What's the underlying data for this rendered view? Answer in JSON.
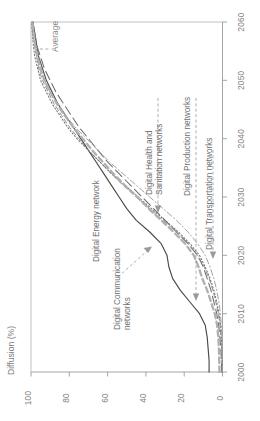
{
  "chart_data": {
    "type": "line",
    "title": "",
    "subtitle": "",
    "orientation": "rotated-90-ccw",
    "xlabel": "",
    "ylabel": "Diffusion (%)",
    "xlim": [
      2000,
      2060
    ],
    "ylim": [
      0,
      100
    ],
    "grid": false,
    "legend_position": "inline-annotations",
    "x_ticks": [
      "2000",
      "2010",
      "2020",
      "2030",
      "2040",
      "2050",
      "2060"
    ],
    "x_tick_values": [
      2000,
      2010,
      2020,
      2030,
      2040,
      2050,
      2060
    ],
    "y_ticks": [
      "0",
      "20",
      "40",
      "60",
      "80",
      "100"
    ],
    "y_tick_values": [
      0,
      20,
      40,
      60,
      80,
      100
    ],
    "x": [
      2000,
      2002,
      2004,
      2006,
      2008,
      2010,
      2012,
      2014,
      2016,
      2018,
      2020,
      2022,
      2024,
      2026,
      2028,
      2030,
      2032,
      2034,
      2036,
      2038,
      2040,
      2042,
      2044,
      2046,
      2048,
      2050,
      2052,
      2054,
      2056,
      2058,
      2060
    ],
    "series": [
      {
        "name": "Digital Communication networks",
        "style": "solid",
        "color": "#4a4a4a",
        "values": [
          7,
          7,
          7.5,
          8,
          9,
          12,
          17,
          22,
          26,
          28,
          29,
          32,
          38,
          45,
          50,
          54,
          58,
          62,
          66,
          70,
          74,
          78,
          82,
          86,
          89,
          92,
          94,
          96,
          97,
          98,
          99
        ]
      },
      {
        "name": "Digital Energy network",
        "style": "long-dash",
        "color": "#6d6d6d",
        "values": [
          0.4,
          0.6,
          0.9,
          1.4,
          2,
          3,
          4.5,
          6,
          8,
          10,
          13,
          18,
          24,
          30,
          36,
          42,
          48,
          54,
          60,
          65,
          70,
          75,
          79,
          83,
          87,
          90,
          93,
          95,
          97,
          98,
          99
        ]
      },
      {
        "name": "Digital Health and Sanitation networks",
        "style": "dashed",
        "color": "#8c8c8c",
        "values": [
          0.2,
          0.3,
          0.5,
          0.8,
          1.3,
          2.2,
          3.5,
          5,
          7,
          9.5,
          13,
          18,
          24,
          31,
          38,
          45,
          52,
          58,
          64,
          70,
          75,
          80,
          84,
          88,
          91,
          94,
          96,
          97,
          98,
          99,
          99.5
        ]
      },
      {
        "name": "Digital Production networks",
        "style": "dotted",
        "color": "#777777",
        "values": [
          0.1,
          0.2,
          0.35,
          0.6,
          1,
          1.8,
          3,
          4.5,
          6.5,
          9,
          12,
          17,
          23,
          30,
          37,
          44,
          51,
          58,
          64,
          70,
          76,
          81,
          85,
          89,
          92,
          95,
          96.5,
          98,
          98.8,
          99.3,
          99.7
        ]
      },
      {
        "name": "Digital Transportation networks",
        "style": "dash-dot",
        "color": "#9e9e9e",
        "values": [
          0.05,
          0.1,
          0.2,
          0.35,
          0.6,
          1.1,
          1.9,
          3,
          4.5,
          6.5,
          9,
          13,
          18,
          24,
          31,
          38,
          45,
          52,
          59,
          65,
          71,
          77,
          82,
          86,
          90,
          93,
          95.5,
          97,
          98.2,
          99,
          99.5
        ]
      },
      {
        "name": "Average",
        "style": "thick-dashed",
        "color": "#b0b0b0",
        "values": [
          1.6,
          1.7,
          1.9,
          2.2,
          2.8,
          4,
          6,
          8,
          10.5,
          12.5,
          15,
          19.5,
          25.5,
          32,
          38.5,
          44.5,
          51,
          57,
          62.5,
          68,
          73,
          78,
          82.5,
          86.5,
          90,
          93,
          95,
          96.5,
          97.8,
          98.6,
          99.3
        ]
      }
    ],
    "annotations": [
      {
        "label": "Average",
        "anchor": "top-left"
      },
      {
        "label": "Digital Energy network",
        "anchor": "left"
      },
      {
        "label": "Digital Communication networks",
        "anchor": "left"
      },
      {
        "label": "Digital Health and Sanitation networks",
        "anchor": "right"
      },
      {
        "label": "Digital Production networks",
        "anchor": "right"
      },
      {
        "label": "Digital Transportation networks",
        "anchor": "right"
      }
    ]
  },
  "axes": {
    "y_title": "Diffusion (%)",
    "y_tick_0": "0",
    "y_tick_20": "20",
    "y_tick_40": "40",
    "y_tick_60": "60",
    "y_tick_80": "80",
    "y_tick_100": "100",
    "x_tick_2000": "2000",
    "x_tick_2010": "2010",
    "x_tick_2020": "2020",
    "x_tick_2030": "2030",
    "x_tick_2040": "2040",
    "x_tick_2050": "2050",
    "x_tick_2060": "2060"
  },
  "labels": {
    "average": "Average",
    "energy": "Digital Energy network",
    "communication_l1": "Digital Communication",
    "communication_l2": "networks",
    "health_l1": "Digital Health and",
    "health_l2": "Sanitation networks",
    "production": "Digital Production networks",
    "transportation": "Digital Transportation networks"
  }
}
